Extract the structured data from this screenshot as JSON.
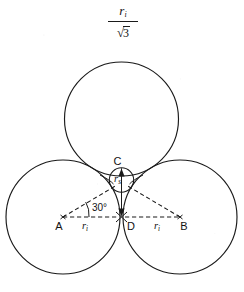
{
  "figure": {
    "kind": "geometry-diagram",
    "background_color": "#ffffff",
    "ink_color": "#1a1a1a"
  },
  "formula": {
    "numerator": "r",
    "numerator_subscript": "i",
    "denominator_radical_sign": "√",
    "denominator_radicand": "3",
    "plain_text": "r_i / √3"
  },
  "labels": {
    "point_a": "A",
    "point_b": "B",
    "point_c": "C",
    "point_d": "D",
    "angle": "30°",
    "radius_left": "r",
    "radius_left_sub": "i",
    "radius_right": "r",
    "radius_right_sub": "i",
    "small_radius": "r",
    "small_radius_sub": "s"
  },
  "geometry": {
    "big_circle_radius": 57,
    "small_circle_radius": 12.2,
    "circles": [
      {
        "name": "left-circle",
        "cx": 63,
        "cy": 217,
        "r": 57
      },
      {
        "name": "right-circle",
        "cx": 180,
        "cy": 217,
        "r": 57
      },
      {
        "name": "top-circle",
        "cx": 121.5,
        "cy": 119,
        "r": 57
      },
      {
        "name": "inscribed-circle",
        "cx": 121.5,
        "cy": 180,
        "r": 12.2
      }
    ],
    "points": [
      {
        "name": "A",
        "x": 63,
        "y": 217
      },
      {
        "name": "B",
        "x": 180,
        "y": 217
      },
      {
        "name": "C",
        "x": 121.5,
        "y": 180
      },
      {
        "name": "D",
        "x": 121.5,
        "y": 217
      }
    ],
    "angle_at_a_degrees": 30,
    "dashed_segments": [
      {
        "name": "segment-ad",
        "x1": 63,
        "y1": 217,
        "x2": 121.5,
        "y2": 217
      },
      {
        "name": "segment-db",
        "x1": 121.5,
        "y1": 217,
        "x2": 180,
        "y2": 217
      },
      {
        "name": "segment-ac",
        "x1": 63,
        "y1": 217,
        "x2": 121.5,
        "y2": 183
      },
      {
        "name": "segment-bc",
        "x1": 180,
        "y1": 217,
        "x2": 121.5,
        "y2": 183
      }
    ]
  }
}
